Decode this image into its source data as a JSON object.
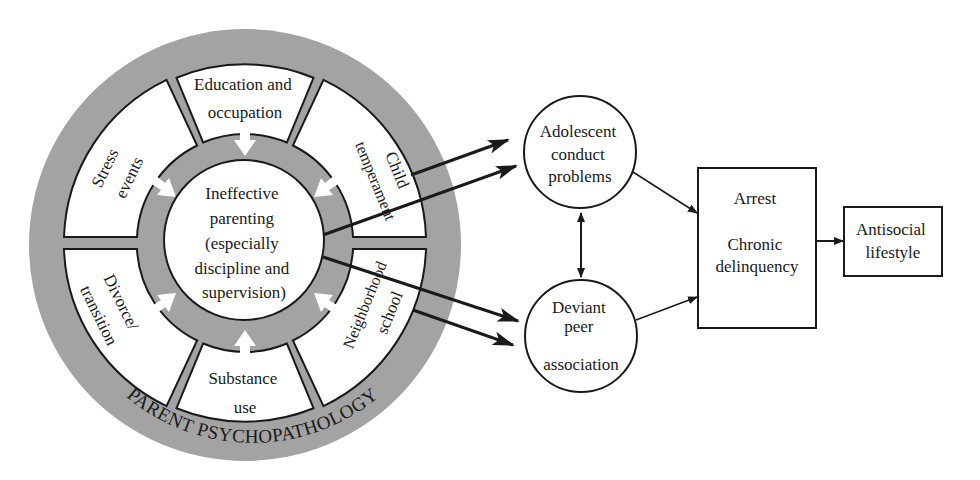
{
  "colors": {
    "ring_gray": "#a3a3a3",
    "stroke": "#1a1a1a",
    "fill": "#ffffff"
  },
  "outer_ring": {
    "label": "PARENT PSYCHOPATHOLOGY"
  },
  "center": {
    "lines": [
      "Ineffective",
      "parenting",
      "(especially",
      "discipline and",
      "supervision)"
    ]
  },
  "segments": [
    {
      "id": "education",
      "lines": [
        "Education and",
        "occupation"
      ]
    },
    {
      "id": "child",
      "lines": [
        "Child",
        "temperament"
      ]
    },
    {
      "id": "neighborhood",
      "lines": [
        "Neighborhood",
        "school"
      ]
    },
    {
      "id": "substance",
      "lines": [
        "Substance",
        "use"
      ]
    },
    {
      "id": "divorce",
      "lines": [
        "Divorce/",
        "transition"
      ]
    },
    {
      "id": "stress",
      "lines": [
        "Stress",
        "events"
      ]
    }
  ],
  "nodes": {
    "adolescent": {
      "lines": [
        "Adolescent",
        "conduct",
        "problems"
      ]
    },
    "deviant": {
      "lines": [
        "Deviant",
        "peer",
        "association"
      ]
    },
    "arrest": {
      "lines": [
        "Arrest",
        "Chronic",
        "delinquency"
      ]
    },
    "antisocial": {
      "lines": [
        "Antisocial",
        "lifestyle"
      ]
    }
  }
}
